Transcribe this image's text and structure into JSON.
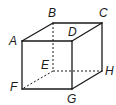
{
  "diagram": {
    "type": "cube",
    "vertices": [
      {
        "id": "A",
        "label": "A",
        "x": 22,
        "y": 41,
        "lx": 9,
        "ly": 35
      },
      {
        "id": "B",
        "label": "B",
        "x": 53,
        "y": 23,
        "lx": 48,
        "ly": 7
      },
      {
        "id": "C",
        "label": "C",
        "x": 102,
        "y": 23,
        "lx": 99,
        "ly": 7
      },
      {
        "id": "D",
        "label": "D",
        "x": 72,
        "y": 41,
        "lx": 68,
        "ly": 26
      },
      {
        "id": "E",
        "label": "E",
        "x": 53,
        "y": 71,
        "lx": 41,
        "ly": 59
      },
      {
        "id": "F",
        "label": "F",
        "x": 22,
        "y": 89,
        "lx": 10,
        "ly": 81
      },
      {
        "id": "G",
        "label": "G",
        "x": 72,
        "y": 89,
        "lx": 67,
        "ly": 93
      },
      {
        "id": "H",
        "label": "H",
        "x": 102,
        "y": 71,
        "lx": 105,
        "ly": 65
      }
    ],
    "edges_solid": [
      [
        "A",
        "B"
      ],
      [
        "B",
        "C"
      ],
      [
        "A",
        "D"
      ],
      [
        "D",
        "C"
      ],
      [
        "A",
        "F"
      ],
      [
        "F",
        "G"
      ],
      [
        "D",
        "G"
      ],
      [
        "C",
        "H"
      ],
      [
        "G",
        "H"
      ]
    ],
    "edges_hidden": [
      [
        "B",
        "E"
      ],
      [
        "E",
        "F"
      ],
      [
        "E",
        "H"
      ]
    ],
    "line_color": "#1a1a1a"
  }
}
